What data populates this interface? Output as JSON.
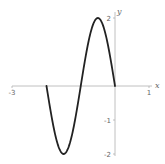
{
  "chart_data": {
    "type": "line",
    "title": "",
    "xlabel": "x",
    "ylabel": "y",
    "xlim": [
      -3,
      1
    ],
    "ylim": [
      -2,
      2
    ],
    "grid": false,
    "legend": null,
    "x_ticks": [
      {
        "value": -3,
        "label": "-3"
      },
      {
        "value": 1,
        "label": "1"
      }
    ],
    "y_ticks": [
      {
        "value": 2,
        "label": "2"
      },
      {
        "value": -1,
        "label": "-1"
      },
      {
        "value": -2,
        "label": "-2"
      }
    ],
    "series": [
      {
        "name": "y = -2 sin(πx)",
        "color": "#222222",
        "x": [
          -2,
          -1.75,
          -1.5,
          -1.25,
          -1,
          -0.75,
          -0.5,
          -0.25,
          0
        ],
        "values": [
          0,
          -1.41,
          -2,
          -1.41,
          0,
          1.41,
          2,
          1.41,
          0
        ]
      }
    ]
  },
  "axes": {
    "x_label": "x",
    "y_label": "y",
    "axis_color": "#b0b0b0",
    "curve_color": "#222222"
  }
}
